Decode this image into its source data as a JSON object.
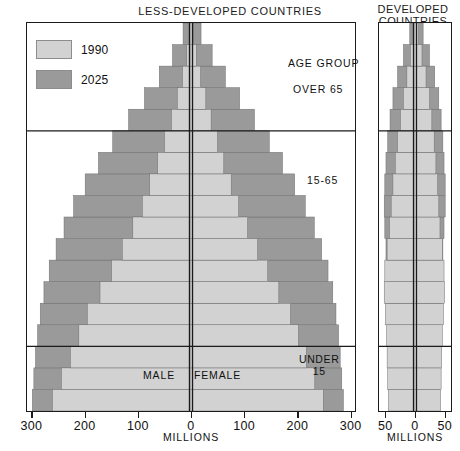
{
  "titles": {
    "left_panel": "LESS-DEVELOPED COUNTRIES",
    "right_panel": "DEVELOPED\nCOUNTRIES",
    "right_panel_line1": "DEVELOPED",
    "right_panel_line2": "COUNTRIES"
  },
  "legend": {
    "items": [
      {
        "label": "1990",
        "color": "#d2d2d2"
      },
      {
        "label": "2025",
        "color": "#9a9a9a"
      }
    ]
  },
  "annotations": {
    "age_group": "AGE GROUP",
    "over_65": "OVER 65",
    "band_15_65": "15-65",
    "male": "MALE",
    "female": "FEMALE",
    "under_15_line1": "UNDER",
    "under_15_line2": "15"
  },
  "axes": {
    "left": {
      "title": "MILLIONS",
      "tick_labels": [
        "300",
        "200",
        "100",
        "0",
        "100",
        "200",
        "300"
      ],
      "tick_values": [
        -300,
        -200,
        -100,
        0,
        100,
        200,
        300
      ],
      "min": -310,
      "max": 310
    },
    "right": {
      "title": "MILLIONS",
      "tick_labels": [
        "50",
        "0",
        "50"
      ],
      "tick_values": [
        -50,
        0,
        50
      ],
      "min": -62,
      "max": 62
    }
  },
  "chart_data": {
    "type": "bar",
    "chart_kind": "population-pyramid",
    "xlabel": "MILLIONS",
    "ylabel": "AGE GROUP",
    "grid": false,
    "legend_position": "top-left",
    "age_bands": {
      "under_15": "UNDER 15",
      "working": "15-65",
      "over_65": "OVER 65"
    },
    "band_boundaries_age": [
      15,
      65
    ],
    "age_groups": [
      "0-4",
      "5-9",
      "10-14",
      "15-19",
      "20-24",
      "25-29",
      "30-34",
      "35-39",
      "40-44",
      "45-49",
      "50-54",
      "55-59",
      "60-64",
      "65-69",
      "70-74",
      "75-79",
      "80-84",
      "85+"
    ],
    "panels": [
      {
        "name": "LESS-DEVELOPED COUNTRIES",
        "xlim": [
          -310,
          310
        ],
        "sides": [
          "MALE",
          "FEMALE"
        ],
        "series": [
          {
            "name": "1990",
            "color": "#d2d2d2",
            "male": [
              262,
              245,
              228,
              212,
              196,
              172,
              150,
              130,
              110,
              92,
              78,
              63,
              50,
              37,
              26,
              16,
              8,
              3
            ],
            "female": [
              250,
              234,
              218,
              203,
              188,
              166,
              145,
              126,
              107,
              90,
              76,
              62,
              50,
              38,
              28,
              18,
              10,
              4
            ]
          },
          {
            "name": "2025",
            "color": "#9a9a9a",
            "male": [
              300,
              297,
              294,
              290,
              285,
              278,
              268,
              255,
              240,
              222,
              200,
              175,
              148,
              118,
              88,
              60,
              35,
              15
            ],
            "female": [
              288,
              285,
              282,
              279,
              274,
              268,
              259,
              247,
              233,
              216,
              196,
              173,
              148,
              120,
              92,
              65,
              40,
              19
            ]
          }
        ]
      },
      {
        "name": "DEVELOPED COUNTRIES",
        "xlim": [
          -62,
          62
        ],
        "sides": [
          "MALE",
          "FEMALE"
        ],
        "series": [
          {
            "name": "1990",
            "color": "#d2d2d2",
            "male": [
              46,
              47,
              48,
              49,
              51,
              53,
              52,
              48,
              44,
              41,
              38,
              34,
              30,
              25,
              20,
              14,
              8,
              3
            ],
            "female": [
              44,
              45,
              46,
              47,
              49,
              51,
              50,
              47,
              43,
              41,
              39,
              36,
              33,
              29,
              25,
              19,
              12,
              6
            ]
          },
          {
            "name": "2025",
            "color": "#9a9a9a",
            "male": [
              42,
              43,
              44,
              45,
              46,
              47,
              48,
              50,
              52,
              53,
              52,
              50,
              47,
              43,
              38,
              30,
              20,
              9
            ],
            "female": [
              40,
              41,
              42,
              43,
              44,
              45,
              46,
              48,
              50,
              52,
              52,
              50,
              48,
              45,
              41,
              34,
              25,
              14
            ]
          }
        ]
      }
    ]
  }
}
